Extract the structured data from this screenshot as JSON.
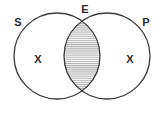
{
  "figure": {
    "type": "venn-diagram",
    "title": "",
    "background_color": "#ffffff",
    "stroke_color": "#3a3a3a",
    "label_color": "#2b2b2b",
    "shading_color": "#b4b4b4",
    "shading_background": "#f7f7f7",
    "shading_style": "horizontal-hatch"
  },
  "sets": {
    "left": {
      "label": "S",
      "label_x": 18,
      "label_y": 23,
      "center_x": 57,
      "center_y": 56,
      "radius": 43,
      "region_mark": "X",
      "region_mark_x": 38,
      "region_mark_y": 60
    },
    "right": {
      "label": "P",
      "label_x": 146,
      "label_y": 23,
      "center_x": 107,
      "center_y": 56,
      "radius": 43,
      "region_mark": "X",
      "region_mark_x": 130,
      "region_mark_y": 60
    }
  },
  "intersection": {
    "label": "E",
    "label_x": 85,
    "label_y": 10,
    "shaded": true,
    "top_point_y": 21,
    "bottom_point_y": 92,
    "left_x": 64,
    "right_x": 100
  }
}
